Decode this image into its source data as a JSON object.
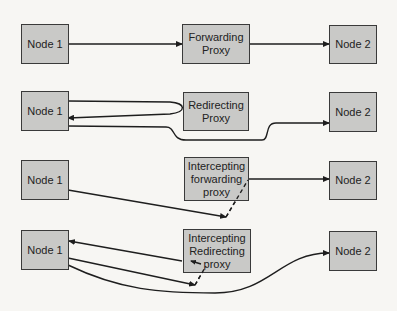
{
  "diagram": {
    "colors": {
      "background": "#f7f6f3",
      "box_fill": "#c9c9c7",
      "box_border": "#3a3a3a",
      "line": "#1e1e1e"
    },
    "rows": [
      {
        "node1": "Node 1",
        "proxy": "Forwarding\nProxy",
        "node2": "Node 2"
      },
      {
        "node1": "Node 1",
        "proxy": "Redirecting\nProxy",
        "node2": "Node 2"
      },
      {
        "node1": "Node 1",
        "proxy": "Intercepting\nforwarding\nproxy",
        "node2": "Node 2"
      },
      {
        "node1": "Node 1",
        "proxy": "Intercepting\nRedirecting\nproxy",
        "node2": "Node 2"
      }
    ]
  }
}
